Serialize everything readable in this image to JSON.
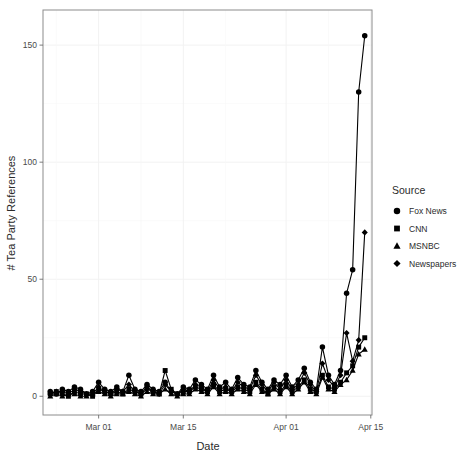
{
  "chart_data": {
    "type": "line",
    "title": "",
    "subtitle": "",
    "xlabel": "Date",
    "ylabel": "# Tea Party References",
    "legend_title": "Source",
    "legend_position": "right",
    "grid": true,
    "xlim": [
      "2010-02-21",
      "2010-04-14"
    ],
    "ylim": [
      -8,
      165
    ],
    "yticks": [
      0,
      50,
      100,
      150
    ],
    "ytick_labels": [
      "0",
      "50",
      "100",
      "150"
    ],
    "xticks": [
      "2010-03-01",
      "2010-03-15",
      "2010-04-01",
      "2010-04-15"
    ],
    "xtick_labels": [
      "Mar 01",
      "Mar 15",
      "Apr 01",
      "Apr 15"
    ],
    "x": [
      "2010-02-21",
      "2010-02-22",
      "2010-02-23",
      "2010-02-24",
      "2010-02-25",
      "2010-02-26",
      "2010-02-27",
      "2010-02-28",
      "2010-03-01",
      "2010-03-02",
      "2010-03-03",
      "2010-03-04",
      "2010-03-05",
      "2010-03-06",
      "2010-03-07",
      "2010-03-08",
      "2010-03-09",
      "2010-03-10",
      "2010-03-11",
      "2010-03-12",
      "2010-03-13",
      "2010-03-14",
      "2010-03-15",
      "2010-03-16",
      "2010-03-17",
      "2010-03-18",
      "2010-03-19",
      "2010-03-20",
      "2010-03-21",
      "2010-03-22",
      "2010-03-23",
      "2010-03-24",
      "2010-03-25",
      "2010-03-26",
      "2010-03-27",
      "2010-03-28",
      "2010-03-29",
      "2010-03-30",
      "2010-03-31",
      "2010-04-01",
      "2010-04-02",
      "2010-04-03",
      "2010-04-04",
      "2010-04-05",
      "2010-04-06",
      "2010-04-07",
      "2010-04-08",
      "2010-04-09",
      "2010-04-10",
      "2010-04-11",
      "2010-04-12",
      "2010-04-13",
      "2010-04-14"
    ],
    "series": [
      {
        "name": "Fox News",
        "marker": "circle",
        "values": [
          2,
          1,
          3,
          2,
          4,
          3,
          1,
          2,
          6,
          3,
          2,
          4,
          2,
          9,
          3,
          2,
          5,
          3,
          2,
          6,
          2,
          1,
          4,
          3,
          7,
          5,
          3,
          9,
          4,
          6,
          3,
          8,
          5,
          4,
          11,
          6,
          3,
          7,
          5,
          9,
          4,
          7,
          12,
          6,
          3,
          21,
          9,
          5,
          11,
          44,
          54,
          130,
          154
        ]
      },
      {
        "name": "CNN",
        "marker": "square",
        "values": [
          1,
          2,
          1,
          0,
          2,
          1,
          1,
          0,
          3,
          2,
          1,
          2,
          1,
          3,
          2,
          1,
          4,
          2,
          1,
          11,
          3,
          1,
          2,
          2,
          4,
          3,
          2,
          5,
          2,
          3,
          2,
          4,
          3,
          2,
          6,
          3,
          1,
          4,
          2,
          5,
          2,
          4,
          7,
          3,
          2,
          9,
          4,
          3,
          6,
          10,
          13,
          21,
          25
        ]
      },
      {
        "name": "MSNBC",
        "marker": "triangle",
        "values": [
          0,
          1,
          0,
          1,
          1,
          0,
          0,
          1,
          2,
          1,
          0,
          1,
          1,
          2,
          1,
          0,
          2,
          1,
          1,
          3,
          1,
          0,
          1,
          1,
          3,
          2,
          1,
          4,
          1,
          2,
          1,
          3,
          2,
          1,
          5,
          2,
          1,
          3,
          1,
          4,
          1,
          3,
          6,
          2,
          1,
          8,
          3,
          2,
          5,
          7,
          11,
          18,
          20
        ]
      },
      {
        "name": "Newspapers",
        "marker": "diamond",
        "values": [
          1,
          2,
          2,
          1,
          3,
          2,
          1,
          1,
          4,
          2,
          1,
          3,
          2,
          5,
          2,
          1,
          3,
          2,
          1,
          5,
          2,
          1,
          3,
          2,
          5,
          4,
          2,
          7,
          3,
          4,
          2,
          6,
          4,
          3,
          9,
          5,
          2,
          6,
          3,
          7,
          3,
          5,
          10,
          5,
          2,
          14,
          7,
          4,
          9,
          27,
          15,
          24,
          70
        ]
      }
    ]
  },
  "legend": {
    "title": "Source",
    "items": [
      {
        "label": "Fox News",
        "marker": "circle"
      },
      {
        "label": "CNN",
        "marker": "square"
      },
      {
        "label": "MSNBC",
        "marker": "triangle"
      },
      {
        "label": "Newspapers",
        "marker": "diamond"
      }
    ]
  },
  "axes": {
    "x_title": "Date",
    "y_title": "# Tea Party References"
  }
}
